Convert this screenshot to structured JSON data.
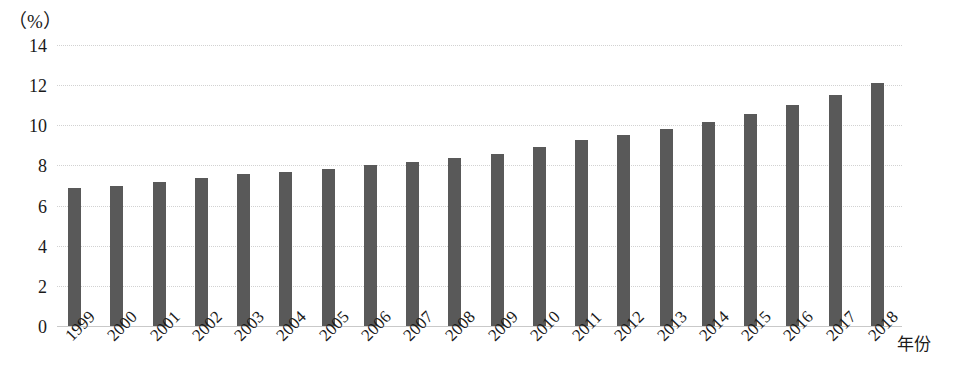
{
  "chart_data": {
    "type": "bar",
    "title": "",
    "subtitle": "",
    "xlabel": "年份",
    "ylabel": "（%）",
    "ylim": [
      0,
      14
    ],
    "ytick_step": 2,
    "yticks": [
      "14",
      "12",
      "10",
      "8",
      "6",
      "4",
      "2",
      "0"
    ],
    "ytick_values": [
      14,
      12,
      10,
      8,
      6,
      4,
      2,
      0
    ],
    "grid": true,
    "grid_axis": "y",
    "legend": false,
    "legend_position": "none",
    "categories": [
      "1999",
      "2000",
      "2001",
      "2002",
      "2003",
      "2004",
      "2005",
      "2006",
      "2007",
      "2008",
      "2009",
      "2010",
      "2011",
      "2012",
      "2013",
      "2014",
      "2015",
      "2016",
      "2017",
      "2018"
    ],
    "values": [
      6.9,
      7.0,
      7.2,
      7.35,
      7.55,
      7.65,
      7.8,
      8.0,
      8.15,
      8.35,
      8.55,
      8.9,
      9.25,
      9.5,
      9.8,
      10.15,
      10.55,
      11.0,
      11.5,
      12.1
    ],
    "series": [
      {
        "name": "",
        "color": "#595959",
        "values": [
          6.9,
          7.0,
          7.2,
          7.35,
          7.55,
          7.65,
          7.8,
          8.0,
          8.15,
          8.35,
          8.55,
          8.9,
          9.25,
          9.5,
          9.8,
          10.15,
          10.55,
          11.0,
          11.5,
          12.1
        ]
      }
    ],
    "annotations": [],
    "colors": {
      "bar": "#595959",
      "gridline": "#d2d2d2",
      "axis": "#c9c9c9",
      "text": "#1a1a1a",
      "background": "#ffffff"
    }
  }
}
